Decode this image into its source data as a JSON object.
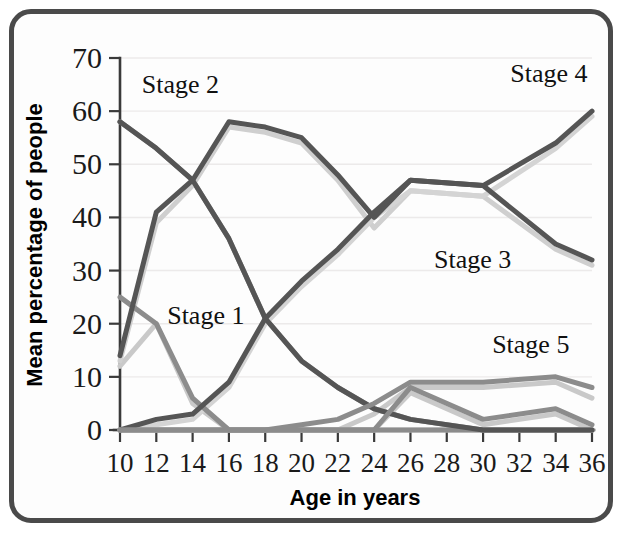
{
  "figure": {
    "border_color": "#4a4a4a",
    "background": "#fdfdfd"
  },
  "chart_data": {
    "type": "line",
    "title": "",
    "xlabel": "Age in years",
    "ylabel": "Mean percentage of people",
    "xlim": [
      10,
      36
    ],
    "ylim": [
      0,
      70
    ],
    "xticks": [
      10,
      12,
      14,
      16,
      18,
      20,
      22,
      24,
      26,
      28,
      30,
      32,
      34,
      36
    ],
    "yticks": [
      0,
      10,
      20,
      30,
      40,
      50,
      60,
      70
    ],
    "xtick_labels": [
      "10",
      "12",
      "14",
      "16",
      "18",
      "20",
      "22",
      "24",
      "26",
      "28",
      "30",
      "32",
      "34",
      "36"
    ],
    "ytick_labels": [
      "0",
      "10",
      "20",
      "30",
      "40",
      "50",
      "60",
      "70"
    ],
    "grid": true,
    "grid_axis": "y",
    "legend_position": "inline-annotations",
    "x": [
      10,
      12,
      14,
      16,
      18,
      20,
      22,
      24,
      26,
      30,
      34,
      36
    ],
    "series": [
      {
        "name": "Stage 1",
        "color": "#8c8c8c",
        "width": 5,
        "values": [
          25,
          20,
          6,
          0,
          0,
          0,
          0,
          0,
          0,
          0,
          0,
          0
        ]
      },
      {
        "name": "Stage 1b",
        "color": "#c9c9c9",
        "width": 5,
        "values": [
          12,
          20,
          5,
          0,
          0,
          0,
          0,
          0,
          0,
          0,
          0,
          0
        ]
      },
      {
        "name": "Stage 2",
        "color": "#555555",
        "width": 5,
        "values": [
          58,
          53,
          47,
          36,
          21,
          13,
          8,
          4,
          2,
          0,
          0,
          0
        ]
      },
      {
        "name": "Stage 2b",
        "color": "#9a9a9a",
        "width": 5,
        "values": [
          58,
          53,
          47,
          36,
          21,
          13,
          8,
          4,
          2,
          0,
          0,
          0
        ]
      },
      {
        "name": "Stage 3",
        "color": "#555555",
        "width": 5,
        "values": [
          14,
          41,
          47,
          58,
          57,
          55,
          48,
          40,
          47,
          46,
          35,
          32
        ]
      },
      {
        "name": "Stage 3b",
        "color": "#cfcfcf",
        "width": 5,
        "values": [
          13,
          39,
          46,
          57,
          56,
          54,
          47,
          38,
          45,
          44,
          34,
          31
        ]
      },
      {
        "name": "Stage 4",
        "color": "#555555",
        "width": 5,
        "values": [
          0,
          2,
          3,
          9,
          21,
          28,
          34,
          41,
          47,
          46,
          54,
          60
        ]
      },
      {
        "name": "Stage 4b",
        "color": "#d4d4d4",
        "width": 5,
        "values": [
          0,
          1,
          2,
          8,
          20,
          27,
          33,
          40,
          45,
          44,
          53,
          59
        ]
      },
      {
        "name": "Stage 5",
        "color": "#8c8c8c",
        "width": 5,
        "values": [
          0,
          0,
          0,
          0,
          0,
          1,
          2,
          5,
          9,
          9,
          10,
          8
        ]
      },
      {
        "name": "Stage 5b",
        "color": "#c9c9c9",
        "width": 5,
        "values": [
          0,
          0,
          0,
          0,
          0,
          0,
          0,
          3,
          8,
          8,
          9,
          6
        ]
      },
      {
        "name": "Stage 1 tail",
        "color": "#8c8c8c",
        "width": 5,
        "values": [
          0,
          0,
          0,
          0,
          0,
          0,
          0,
          0,
          8,
          2,
          4,
          1
        ]
      },
      {
        "name": "Stage 1 tail b",
        "color": "#c9c9c9",
        "width": 5,
        "values": [
          0,
          0,
          0,
          0,
          0,
          0,
          0,
          0,
          7,
          1,
          3,
          0
        ]
      }
    ],
    "annotations": [
      {
        "text": "Stage 2",
        "x": 11.2,
        "y": 63.5
      },
      {
        "text": "Stage 1",
        "x": 12.6,
        "y": 20.0
      },
      {
        "text": "Stage 4",
        "x": 31.5,
        "y": 65.5
      },
      {
        "text": "Stage 3",
        "x": 27.3,
        "y": 30.5
      },
      {
        "text": "Stage 5",
        "x": 30.5,
        "y": 14.5
      }
    ]
  }
}
